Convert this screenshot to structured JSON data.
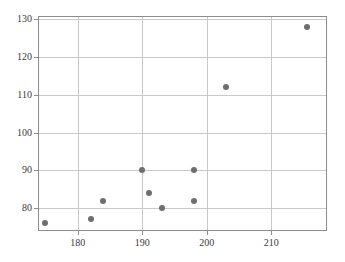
{
  "chart_data": {
    "type": "scatter",
    "title": "",
    "subtitle": "",
    "xlabel": "",
    "ylabel": "",
    "xlim": [
      174.0,
      218.5
    ],
    "ylim": [
      74.2,
      130.6
    ],
    "xticks": [
      180,
      190,
      200,
      210
    ],
    "yticks": [
      80,
      90,
      100,
      110,
      120,
      130
    ],
    "xticklabels": [
      "180",
      "190",
      "200",
      "210"
    ],
    "yticklabels": [
      "80",
      "90",
      "100",
      "110",
      "120",
      "130"
    ],
    "grid": true,
    "legend": false,
    "legend_position": "none",
    "marker": {
      "shape": "circle",
      "color": "#6e6e6e",
      "size_px": 6
    },
    "colors": {
      "marker": "#6e6e6e",
      "gridline": "#c9c9c9",
      "frame": "#8d8d8d",
      "tick_label": "#3a3a3a",
      "background": "#ffffff"
    },
    "series": [
      {
        "name": "series-1",
        "points": [
          {
            "x": 175.0,
            "y": 76.0
          },
          {
            "x": 182.0,
            "y": 77.0
          },
          {
            "x": 184.0,
            "y": 82.0
          },
          {
            "x": 190.0,
            "y": 90.0
          },
          {
            "x": 191.0,
            "y": 84.0
          },
          {
            "x": 193.0,
            "y": 80.0
          },
          {
            "x": 198.0,
            "y": 90.0
          },
          {
            "x": 198.0,
            "y": 82.0
          },
          {
            "x": 203.0,
            "y": 112.0
          },
          {
            "x": 215.5,
            "y": 128.0
          }
        ]
      }
    ],
    "x": [
      175.0,
      182.0,
      184.0,
      190.0,
      191.0,
      193.0,
      198.0,
      198.0,
      203.0,
      215.5
    ],
    "values": [
      76.0,
      77.0,
      82.0,
      90.0,
      84.0,
      80.0,
      90.0,
      82.0,
      112.0,
      128.0
    ],
    "n_points": 10
  }
}
